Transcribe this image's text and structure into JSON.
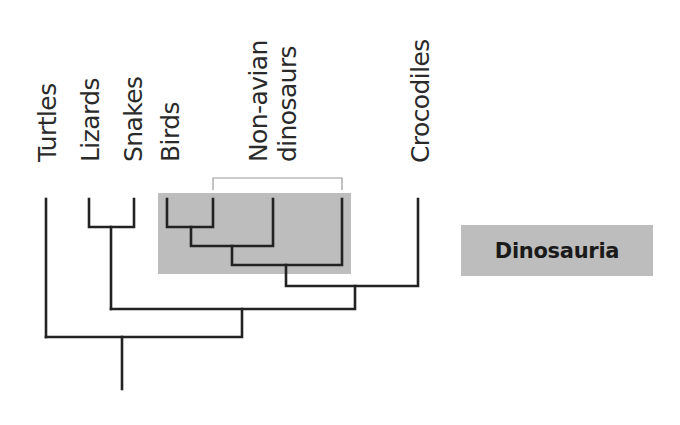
{
  "diagram": {
    "type": "cladogram",
    "colors": {
      "branch": "#222222",
      "highlight_box": "#bdbdbd",
      "bracket": "#9a9a9a",
      "label_box": "#bdbdbd",
      "text": "#2a2a2a"
    },
    "taxa": [
      {
        "id": "turtles",
        "label": "Turtles"
      },
      {
        "id": "lizards",
        "label": "Lizards"
      },
      {
        "id": "snakes",
        "label": "Snakes"
      },
      {
        "id": "birds",
        "label": "Birds"
      },
      {
        "id": "non-avian-dinosaurs",
        "label_line1": "Non-avian",
        "label_line2": "dinosaurs"
      },
      {
        "id": "crocodiles",
        "label": "Crocodiles"
      }
    ],
    "clade_highlight": {
      "label": "Dinosauria",
      "members": [
        "Birds",
        "Non-avian dinosaurs"
      ]
    },
    "tree_newick": "(Turtles,((Lizards,Snakes),(((((Birds,Dino1),Dino2),Dino3),Crocodiles))));"
  }
}
